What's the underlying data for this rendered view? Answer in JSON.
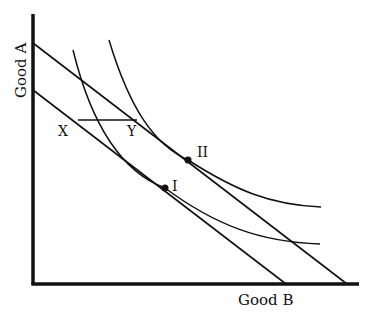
{
  "diagram": {
    "type": "indifference-curve-budget-line",
    "axes": {
      "y_label": "Good A",
      "x_label": "Good B"
    },
    "curves": [
      {
        "id": "I",
        "label": "I",
        "kind": "indifference-curve"
      },
      {
        "id": "II",
        "label": "II",
        "kind": "indifference-curve"
      }
    ],
    "budget_lines": [
      {
        "id": "upper",
        "kind": "budget-line"
      },
      {
        "id": "lower",
        "kind": "budget-line"
      }
    ],
    "points": [
      {
        "label": "I"
      },
      {
        "label": "II"
      }
    ],
    "segment": {
      "left_label": "X",
      "right_label": "Y"
    },
    "colors": {
      "ink": "#111111",
      "background": "#ffffff"
    }
  }
}
